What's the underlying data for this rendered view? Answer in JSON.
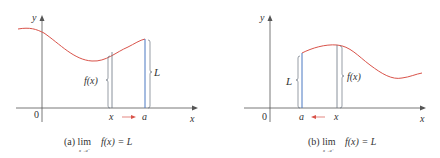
{
  "colors": {
    "curve": "#d9534a",
    "blue_line": "#4a78c2",
    "gray_line": "#6a7480",
    "axis": "#555555",
    "arrow": "#d9534a",
    "text": "#333333"
  },
  "panels": [
    {
      "id": "a",
      "y_axis_label": "y",
      "x_axis_label": "x",
      "origin_label": "0",
      "x_point_label": "x",
      "a_point_label": "a",
      "fx_brace_label": "f(x)",
      "L_brace_label": "L",
      "arrow_direction": "right",
      "caption_prefix": "(a) lim",
      "caption_sub": "x→a⁻",
      "caption_expr": "f(x) = L"
    },
    {
      "id": "b",
      "y_axis_label": "y",
      "x_axis_label": "x",
      "origin_label": "0",
      "x_point_label": "x",
      "a_point_label": "a",
      "fx_brace_label": "f(x)",
      "L_brace_label": "L",
      "arrow_direction": "left",
      "caption_prefix": "(b) lim",
      "caption_sub": "x→a⁺",
      "caption_expr": "f(x) = L"
    }
  ]
}
